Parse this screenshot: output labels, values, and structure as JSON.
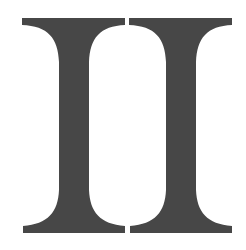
{
  "figure": {
    "text": "II",
    "glyph_count": 2,
    "glyphs": [
      {
        "name": "left-numeral-I",
        "character": "I"
      },
      {
        "name": "right-numeral-I",
        "character": "I"
      }
    ],
    "colors": {
      "ink": "#474747",
      "background": "#ffffff"
    }
  }
}
